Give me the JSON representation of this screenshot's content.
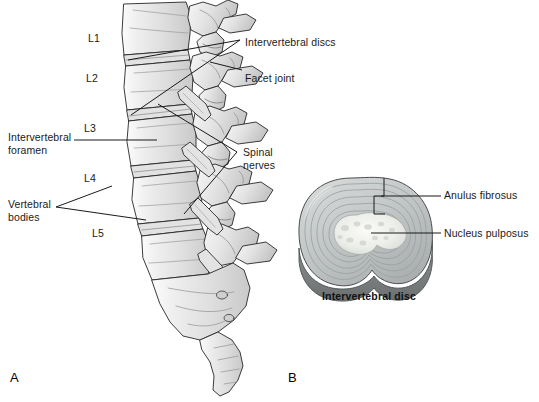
{
  "figure": {
    "background_color": "#ffffff",
    "line_color": "#1a1a1a",
    "bone_fill": "#e9e9e9",
    "bone_shadow": "#b8b8b8",
    "disc_ring_color": "#b9bdbd",
    "nucleus_color": "#f0f0ec"
  },
  "panels": {
    "a": {
      "letter": "A",
      "vertebra_labels": [
        {
          "text": "L1",
          "x": 88,
          "y": 32
        },
        {
          "text": "L2",
          "x": 86,
          "y": 72
        },
        {
          "text": "L3",
          "x": 84,
          "y": 122
        },
        {
          "text": "L4",
          "x": 84,
          "y": 172
        },
        {
          "text": "L5",
          "x": 92,
          "y": 227
        }
      ],
      "callouts": [
        {
          "name": "intervertebral-discs",
          "text": "Intervertebral discs",
          "x": 245,
          "y": 36
        },
        {
          "name": "facet-joint",
          "text": "Facet joint",
          "x": 245,
          "y": 72
        },
        {
          "name": "intervertebral-foramen",
          "text": "Intervertebral\nforamen",
          "x": 8,
          "y": 131
        },
        {
          "name": "spinal-nerves",
          "text": "Spinal\nnerves",
          "x": 243,
          "y": 146
        },
        {
          "name": "vertebral-bodies",
          "text": "Vertebral\nbodies",
          "x": 8,
          "y": 198
        }
      ]
    },
    "b": {
      "letter": "B",
      "caption": "Intervertebral disc",
      "callouts": [
        {
          "name": "anulus-fibrosus",
          "text": "Anulus fibrosus",
          "x": 444,
          "y": 189
        },
        {
          "name": "nucleus-pulposus",
          "text": "Nucleus pulposus",
          "x": 444,
          "y": 227
        }
      ]
    }
  }
}
